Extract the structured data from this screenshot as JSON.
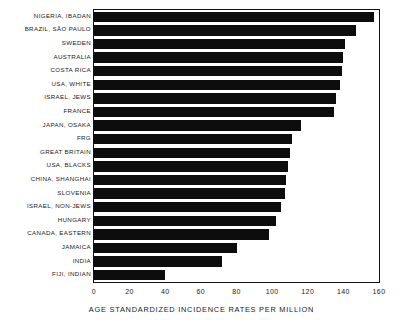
{
  "chart_data": {
    "type": "bar",
    "orientation": "horizontal",
    "title": "",
    "xlabel": "AGE STANDARDIZED INCIDENCE RATES PER MILLION",
    "ylabel": "",
    "xlim": [
      0,
      160
    ],
    "xticks": [
      0,
      20,
      40,
      60,
      80,
      100,
      120,
      140,
      160
    ],
    "xtick_labels": [
      "0",
      "20",
      "40",
      "60",
      "80",
      "100",
      "120",
      "140",
      "160"
    ],
    "grid": false,
    "legend": false,
    "bar_color": "#0d0d0d",
    "categories": [
      "NIGERIA, IBADAN",
      "BRAZIL, SÃO PAULO",
      "SWEDEN",
      "AUSTRALIA",
      "COSTA RICA",
      "USA, WHITE",
      "ISRAEL, JEWS",
      "FRANCE",
      "JAPAN, OSAKA",
      "FRG",
      "GREAT BRITAIN",
      "USA, BLACKS",
      "CHINA, SHANGHAI",
      "SLOVENIA",
      "ISRAEL, NON-JEWS",
      "HUNGARY",
      "CANADA, EASTERN",
      "JAMAICA",
      "INDIA",
      "FIJI, INDIAN"
    ],
    "values": [
      157,
      147,
      141,
      140,
      139,
      138,
      136,
      135,
      116,
      111,
      110,
      109,
      108,
      107,
      105,
      102,
      98,
      80,
      72,
      40
    ]
  }
}
